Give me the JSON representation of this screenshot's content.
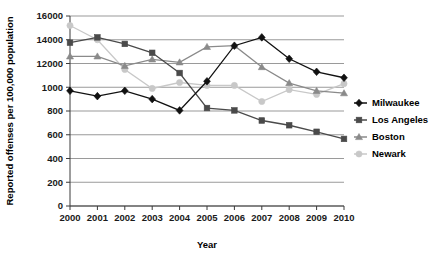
{
  "chart_data": {
    "type": "line",
    "title": "",
    "xlabel": "Year",
    "ylabel": "Reported offenses per 100,000 population",
    "categories": [
      "2000",
      "2001",
      "2002",
      "2003",
      "2004",
      "2005",
      "2006",
      "2007",
      "2008",
      "2009",
      "2010"
    ],
    "x": [
      2000,
      2001,
      2002,
      2003,
      2004,
      2005,
      2006,
      2007,
      2008,
      2009,
      2010
    ],
    "ytick_labels": [
      "0",
      "200",
      "400",
      "600",
      "800",
      "1000",
      "12000",
      "14000",
      "16000"
    ],
    "ytick_positions": [
      0,
      2000,
      4000,
      6000,
      8000,
      10000,
      12000,
      14000,
      16000
    ],
    "ylim": [
      0,
      16000
    ],
    "xlim": [
      2000,
      2010
    ],
    "grid": true,
    "legend_position": "right",
    "series": [
      {
        "name": "Milwaukee",
        "color": "#111111",
        "marker": "diamond",
        "values": [
          9700,
          9250,
          9700,
          9000,
          8050,
          10500,
          13500,
          14200,
          12400,
          11300,
          10800
        ]
      },
      {
        "name": "Los Angeles",
        "color": "#4a4a4a",
        "marker": "square",
        "values": [
          13750,
          14200,
          13650,
          12900,
          11200,
          8250,
          8050,
          7200,
          6800,
          6250,
          5650
        ]
      },
      {
        "name": "Boston",
        "color": "#8a8a8a",
        "marker": "triangle",
        "values": [
          12600,
          12600,
          11800,
          12350,
          12100,
          13400,
          13500,
          11700,
          10350,
          9700,
          9500
        ]
      },
      {
        "name": "Newark",
        "color": "#c8c8c8",
        "marker": "circle",
        "values": [
          15200,
          14000,
          11500,
          9900,
          10400,
          10150,
          10150,
          8800,
          9800,
          9400,
          10300
        ]
      }
    ]
  },
  "legend": {
    "items": [
      {
        "label": "Milwaukee",
        "color": "#111111",
        "marker": "diamond"
      },
      {
        "label": "Los Angeles",
        "color": "#4a4a4a",
        "marker": "square"
      },
      {
        "label": "Boston",
        "color": "#8a8a8a",
        "marker": "triangle"
      },
      {
        "label": "Newark",
        "color": "#c8c8c8",
        "marker": "circle"
      }
    ]
  }
}
